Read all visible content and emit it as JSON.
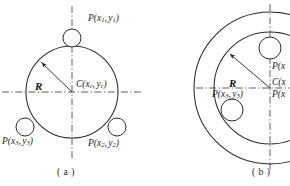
{
  "figure": {
    "title_visible": false,
    "background_color": "#ffffff",
    "stroke_color": "#2b2b2b",
    "axis_style": "dash-dot"
  },
  "panels": [
    {
      "id": "a",
      "caption": "( a )",
      "description": "single circle with three tangent small circles",
      "center": {
        "cx": 72,
        "cy": 92
      },
      "main_circle": {
        "r": 46
      },
      "axes": {
        "vertical": {
          "x": 72,
          "y1": 6,
          "y2": 160
        },
        "horizontal": {
          "y": 92,
          "x1": 2,
          "x2": 142
        }
      },
      "radius_arrow": {
        "label": "R",
        "from": {
          "x": 72,
          "y": 92
        },
        "to": {
          "x": 39,
          "y": 60
        }
      },
      "small_circles": [
        {
          "name": "p1",
          "cx": 72,
          "cy": 38,
          "r": 9
        },
        {
          "name": "p3",
          "cx": 24,
          "cy": 130,
          "r": 9
        },
        {
          "name": "p2",
          "cx": 118,
          "cy": 130,
          "r": 9
        }
      ],
      "labels": {
        "p1": {
          "prefix": "P(x",
          "sub1": "1",
          "mid": ",",
          "var2": "y",
          "sub2": "1",
          "suffix": ")"
        },
        "center": {
          "prefix": "C(x",
          "sub1": "c",
          "mid": ",",
          "var2": "y",
          "sub2": "c",
          "suffix": ")"
        },
        "p3": {
          "prefix": "P(x",
          "sub1": "3",
          "mid": ",",
          "var2": "y",
          "sub2": "3",
          "suffix": ")"
        },
        "p2": {
          "prefix": "P(x",
          "sub1": "2",
          "mid": ",",
          "var2": "y",
          "sub2": "2",
          "suffix": ")"
        }
      }
    },
    {
      "id": "b",
      "caption": "( b )",
      "description": "two concentric circles with small circles inside, clipped at right edge",
      "center": {
        "cx": 292,
        "cy": 88
      },
      "outer_circle": {
        "r": 76
      },
      "inner_circle": {
        "r": 56
      },
      "axes": {
        "vertical": {
          "x": 292,
          "y1": 4,
          "y2": 172
        },
        "horizontal": {
          "y": 88,
          "x1": 200,
          "x2": 290
        }
      },
      "radius_arrow": {
        "label": "R",
        "from": {
          "x": 292,
          "y": 88
        },
        "to": {
          "x": 250,
          "y": 52
        }
      },
      "small_circles": [
        {
          "name": "p1",
          "cx": 292,
          "cy": 48,
          "r": 11
        },
        {
          "name": "p3",
          "cx": 237,
          "cy": 108,
          "r": 11
        }
      ],
      "labels": {
        "p1": {
          "prefix": "P(x",
          "sub1": "",
          "mid": "",
          "var2": "",
          "sub2": "",
          "suffix": ""
        },
        "center": {
          "prefix": "C(x",
          "sub1": "",
          "mid": "",
          "var2": "",
          "sub2": "",
          "suffix": ""
        },
        "p2": {
          "prefix": "P(x",
          "sub1": "",
          "mid": "",
          "var2": "",
          "sub2": "",
          "suffix": ""
        },
        "p3": {
          "prefix": "P(x",
          "sub1": "3",
          "mid": ",",
          "var2": "y",
          "sub2": "3",
          "suffix": ")"
        }
      }
    }
  ]
}
